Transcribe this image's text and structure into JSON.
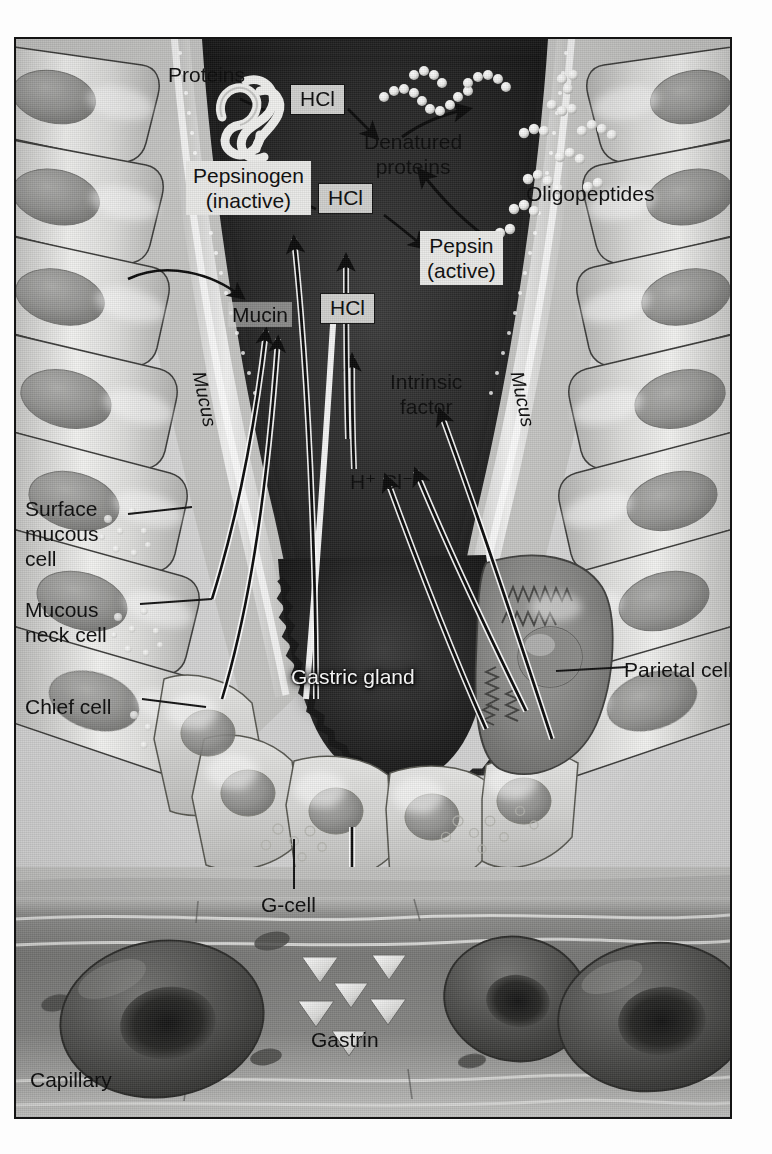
{
  "figure": {
    "background_color": "#d9d9d9",
    "border_color": "#141414",
    "style": "grayscale medical illustration"
  },
  "labels": {
    "proteins": "Proteins",
    "denatured_proteins": "Denatured\nproteins",
    "oligopeptides": "Oligopeptides",
    "pepsinogen": "Pepsinogen\n(inactive)",
    "pepsin": "Pepsin\n(active)",
    "mucin": "Mucin",
    "mucus_left": "Mucus",
    "mucus_right": "Mucus",
    "intrinsic_factor": "Intrinsic\nfactor",
    "ions": "H⁺ Cl⁻",
    "surface_mucous_cell": "Surface\nmucous\ncell",
    "mucous_neck_cell": "Mucous\nneck cell",
    "chief_cell": "Chief cell",
    "gastric_gland": "Gastric gland",
    "parietal_cell": "Parietal cell",
    "g_cell": "G-cell",
    "gastrin": "Gastrin",
    "capillary": "Capillary"
  },
  "hcl_boxes": [
    {
      "label": "HCl",
      "position": "top"
    },
    {
      "label": "HCl",
      "position": "middle"
    },
    {
      "label": "HCl",
      "position": "bottom"
    }
  ],
  "reaction_pathway": {
    "steps": [
      "Proteins + HCl → Denatured proteins",
      "Pepsinogen (inactive) + HCl → Pepsin (active)",
      "Denatured proteins + Pepsin (active) → Oligopeptides",
      "Parietal cell → H⁺ Cl⁻ → HCl",
      "Parietal cell → Intrinsic factor",
      "Mucous cells → Mucin → Mucus",
      "G-cell → Gastrin → Capillary"
    ]
  },
  "cell_types": [
    "Surface mucous cell",
    "Mucous neck cell",
    "Chief cell",
    "Parietal cell",
    "G-cell"
  ],
  "secretions": [
    "Mucin",
    "Pepsinogen",
    "HCl",
    "Intrinsic factor",
    "Gastrin"
  ],
  "colors": {
    "background": "#d9d9d9",
    "lumen_dark": "#2a2a2a",
    "cell_fill": "#c9c9c7",
    "parietal_fill": "#8e8e8c",
    "rbc_dark": "#4a4a4a",
    "label_text": "#0b0b0b",
    "glow_text": "#fbfbfb"
  }
}
